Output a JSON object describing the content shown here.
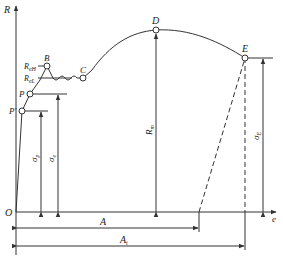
{
  "diagram": {
    "type": "stress-strain curve",
    "axes": {
      "y_label": "R",
      "x_label": "e",
      "origin_label": "O"
    },
    "points": [
      {
        "id": "P_prime",
        "label": "P'"
      },
      {
        "id": "P",
        "label": "P"
      },
      {
        "id": "B",
        "label": "B"
      },
      {
        "id": "C",
        "label": "C"
      },
      {
        "id": "D",
        "label": "D"
      },
      {
        "id": "E",
        "label": "E"
      }
    ],
    "level_labels": {
      "R_eH": {
        "main": "R",
        "sub": "eH"
      },
      "R_eL": {
        "main": "R",
        "sub": "eL"
      }
    },
    "dimensions": {
      "sigma_p": {
        "main": "σ",
        "sub": "p"
      },
      "sigma_e": {
        "main": "σ",
        "sub": "e"
      },
      "R_m": {
        "main": "R",
        "sub": "m"
      },
      "sigma_E": {
        "main": "σ",
        "sub": "E"
      },
      "A": {
        "main": "A",
        "sub": ""
      },
      "A_t": {
        "main": "A",
        "sub": "t"
      }
    },
    "colors": {
      "line": "#333333",
      "background": "#ffffff"
    }
  }
}
